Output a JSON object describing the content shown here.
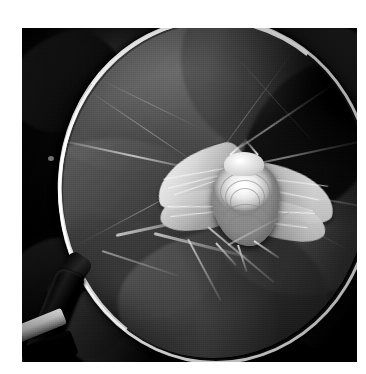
{
  "page": {
    "background_color": "#ffffff",
    "width": 366,
    "height": 374,
    "caption": ""
  },
  "photo": {
    "alt_text": "Black and white photograph of a moth resting on a flower bud, viewed through a magnifying glass held over foliage",
    "color_mode": "grayscale",
    "frame": {
      "x": 22,
      "y": 28,
      "width": 335,
      "height": 334
    },
    "border_color": "#ffffff",
    "dominant_colors": {
      "background_dark": "#111110",
      "lens_field_mid": "#4a4a46",
      "lens_rim_highlight": "#f5f5f0",
      "moth_white": "#f6f5ef",
      "handle_black": "#0a0a0a",
      "ferrule_metal": "#e6e6e0"
    }
  },
  "subjects": {
    "magnifier": {
      "label": "magnifying glass",
      "lens": {
        "cx": 191,
        "cy": 160,
        "rx": 155,
        "ry": 170
      },
      "rim_label": "lens rim",
      "handle_label": "magnifier handle",
      "ferrule_label": "metal ferrule"
    },
    "moth": {
      "label": "moth",
      "parts": [
        "left forewing",
        "left hindwing",
        "right forewing",
        "right hindwing",
        "thorax",
        "head",
        "antennae",
        "legs"
      ]
    },
    "plant": {
      "label": "flower bud and stems",
      "parts": [
        "bud",
        "stems",
        "leaves",
        "leaf veins"
      ]
    }
  },
  "background": {
    "label": "dark foliage",
    "leaf_count": 5
  }
}
